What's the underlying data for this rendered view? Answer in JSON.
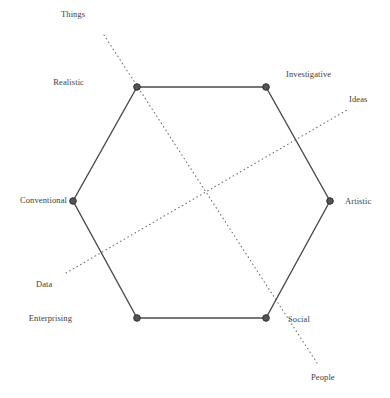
{
  "figure": {
    "width": 390,
    "height": 398,
    "background": "#ffffff",
    "line_color": "#4a4a4a",
    "dot_color": "#555555",
    "dotted_color": "#6b6b6b",
    "text_color": "#3d3d3d"
  },
  "chart_data": {
    "type": "diagram",
    "title": "",
    "subtitle": "",
    "xlabel": "",
    "ylabel": "",
    "grid": false,
    "legend": "none",
    "shape": "hexagon",
    "center": [
      201.5,
      202.5
    ],
    "vertices": [
      {
        "key": "realistic",
        "label": "Realistic",
        "x": 137,
        "y": 87,
        "label_x": 84,
        "label_y": 77,
        "anchor": "right"
      },
      {
        "key": "investigative",
        "label": "Investigative",
        "x": 266,
        "y": 87,
        "label_x": 286,
        "label_y": 69,
        "anchor": "left"
      },
      {
        "key": "artistic",
        "label": "Artistic",
        "x": 330,
        "y": 201,
        "label_x": 345,
        "label_y": 196,
        "anchor": "left"
      },
      {
        "key": "social",
        "label": "Social",
        "x": 266,
        "y": 318,
        "label_x": 288,
        "label_y": 314,
        "anchor": "left"
      },
      {
        "key": "enterprising",
        "label": "Enterprising",
        "x": 137,
        "y": 318,
        "label_x": 72,
        "label_y": 313,
        "anchor": "right"
      },
      {
        "key": "conventional",
        "label": "Conventional",
        "x": 73,
        "y": 201,
        "label_x": 67,
        "label_y": 195,
        "anchor": "right"
      }
    ],
    "edges": [
      [
        "realistic",
        "investigative"
      ],
      [
        "investigative",
        "artistic"
      ],
      [
        "artistic",
        "social"
      ],
      [
        "social",
        "enterprising"
      ],
      [
        "enterprising",
        "conventional"
      ],
      [
        "conventional",
        "realistic"
      ]
    ],
    "axes": [
      {
        "key": "things-people",
        "label_start": "Things",
        "label_end": "People",
        "x1": 104,
        "y1": 35,
        "x2": 317,
        "y2": 363,
        "start_label_x": 61,
        "start_label_y": 9,
        "end_label_x": 311,
        "end_label_y": 372
      },
      {
        "key": "data-ideas",
        "label_start": "Data",
        "label_end": "Ideas",
        "x1": 66,
        "y1": 273,
        "x2": 347,
        "y2": 110,
        "start_label_x": 36,
        "start_label_y": 279,
        "end_label_x": 349,
        "end_label_y": 94
      }
    ],
    "axis_labels": [
      "Things",
      "Ideas",
      "People",
      "Data"
    ],
    "vertex_labels": [
      "Realistic",
      "Investigative",
      "Artistic",
      "Social",
      "Enterprising",
      "Conventional"
    ]
  }
}
